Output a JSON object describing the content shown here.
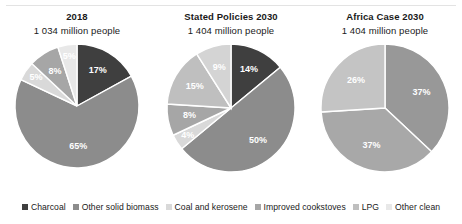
{
  "legend": {
    "position": "bottom",
    "items": [
      {
        "label": "Charcoal",
        "color": "#3f3f3f"
      },
      {
        "label": "Other solid biomass",
        "color": "#8c8c8c"
      },
      {
        "label": "Coal and kerosene",
        "color": "#d9d9d9"
      },
      {
        "label": "Improved cookstoves",
        "color": "#a6a6a6"
      },
      {
        "label": "LPG",
        "color": "#bfbfbf"
      },
      {
        "label": "Other clean",
        "color": "#e8e8e8"
      }
    ]
  },
  "chart_data": [
    {
      "type": "pie",
      "title": "2018",
      "subtitle": "1 034 million people",
      "categories": [
        "Charcoal",
        "Other solid biomass",
        "Coal and kerosene",
        "Improved cookstoves",
        "LPG",
        "Other clean"
      ],
      "values": [
        17,
        65,
        5,
        8,
        5,
        0
      ],
      "labels": [
        "17%",
        "65%",
        "5%",
        "8%",
        "5%",
        ""
      ],
      "colors": [
        "#3f3f3f",
        "#8c8c8c",
        "#d9d9d9",
        "#a6a6a6",
        "#e8e8e8",
        "#f2f2f2"
      ],
      "unit": "percent",
      "startangle": 0,
      "direction": "clockwise"
    },
    {
      "type": "pie",
      "title": "Stated Policies 2030",
      "subtitle": "1 404 million people",
      "categories": [
        "Charcoal",
        "Other solid biomass",
        "Coal and kerosene",
        "Improved cookstoves",
        "LPG",
        "Other clean"
      ],
      "values": [
        14,
        50,
        4,
        8,
        15,
        9
      ],
      "labels": [
        "14%",
        "50%",
        "4%",
        "8%",
        "15%",
        "9%"
      ],
      "colors": [
        "#3f3f3f",
        "#8c8c8c",
        "#d9d9d9",
        "#a6a6a6",
        "#bfbfbf",
        "#d4d4d4"
      ],
      "unit": "percent",
      "startangle": 0,
      "direction": "clockwise"
    },
    {
      "type": "pie",
      "title": "Africa Case 2030",
      "subtitle": "1 404 million people",
      "categories": [
        "Other solid biomass",
        "Improved cookstoves",
        "LPG"
      ],
      "values": [
        37,
        37,
        26
      ],
      "labels": [
        "37%",
        "37%",
        "26%"
      ],
      "colors": [
        "#989898",
        "#a8a8a8",
        "#c4c4c4"
      ],
      "unit": "percent",
      "startangle": 0,
      "direction": "clockwise"
    }
  ]
}
